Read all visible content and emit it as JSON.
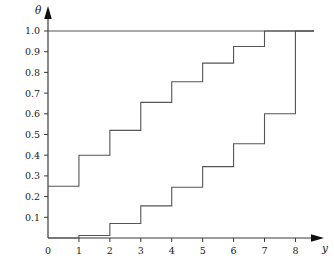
{
  "chart_data": {
    "type": "line",
    "title": "",
    "subtitle": "",
    "xlabel": "y",
    "ylabel": "θ",
    "xlim": [
      0,
      8.6
    ],
    "ylim": [
      0,
      1.04
    ],
    "grid": false,
    "legend": "none",
    "style": "step-post",
    "x_ticks": [
      0,
      1,
      2,
      3,
      4,
      5,
      6,
      7,
      8
    ],
    "x_tick_labels": [
      "0",
      "1",
      "2",
      "3",
      "4",
      "5",
      "6",
      "7",
      "8"
    ],
    "y_ticks": [
      0.1,
      0.2,
      0.3,
      0.4,
      0.5,
      0.6,
      0.7,
      0.8,
      0.9,
      1.0
    ],
    "y_tick_labels": [
      "0.1",
      "0.2",
      "0.3",
      "0.4",
      "0.5",
      "0.6",
      "0.7",
      "0.8",
      "0.9",
      "1.0"
    ],
    "reference_lines": [
      {
        "name": "theta-one-line",
        "orientation": "horizontal",
        "value": 1.0,
        "x_start": 0,
        "x_end": 8.6
      }
    ],
    "series": [
      {
        "name": "upper-step-curve",
        "x": [
          0,
          1,
          2,
          3,
          4,
          5,
          6,
          7,
          8,
          8.6
        ],
        "values": [
          0.25,
          0.4,
          0.52,
          0.655,
          0.755,
          0.845,
          0.925,
          1.0,
          1.0,
          1.0
        ],
        "color": "#555555"
      },
      {
        "name": "lower-step-curve",
        "x": [
          0,
          1,
          2,
          3,
          4,
          5,
          6,
          7,
          8,
          8.6
        ],
        "values": [
          0.0,
          0.012,
          0.07,
          0.155,
          0.245,
          0.345,
          0.455,
          0.6,
          1.0,
          1.0
        ],
        "color": "#555555"
      }
    ],
    "annotations": [],
    "colors": {
      "axis": "#3a3a3a",
      "curve": "#555555",
      "background": "#ffffff",
      "text": "#1a1a1a"
    }
  }
}
